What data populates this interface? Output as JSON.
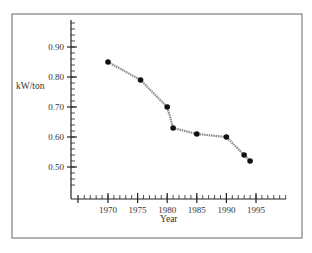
{
  "chart_data": {
    "type": "line",
    "title": "",
    "xlabel": "Year",
    "ylabel": "kW/ton",
    "x_ticks": [
      "1970",
      "1975",
      "1980",
      "1985",
      "1990",
      "1995"
    ],
    "y_ticks": [
      "0.50",
      "0.60",
      "0.70",
      "0.80",
      "0.90"
    ],
    "xlim": [
      1964,
      2000
    ],
    "ylim": [
      0.43,
      1.0
    ],
    "grid": false,
    "legend": null,
    "series": [
      {
        "name": "kW/ton",
        "x": [
          1970,
          1975.5,
          1980,
          1981,
          1985,
          1990,
          1993,
          1994
        ],
        "y": [
          0.85,
          0.79,
          0.7,
          0.63,
          0.61,
          0.6,
          0.54,
          0.52
        ]
      }
    ],
    "colors": {
      "line": "#8a8a8a",
      "marker": "#111111",
      "axis": "#222222",
      "frame": "#555555"
    }
  }
}
